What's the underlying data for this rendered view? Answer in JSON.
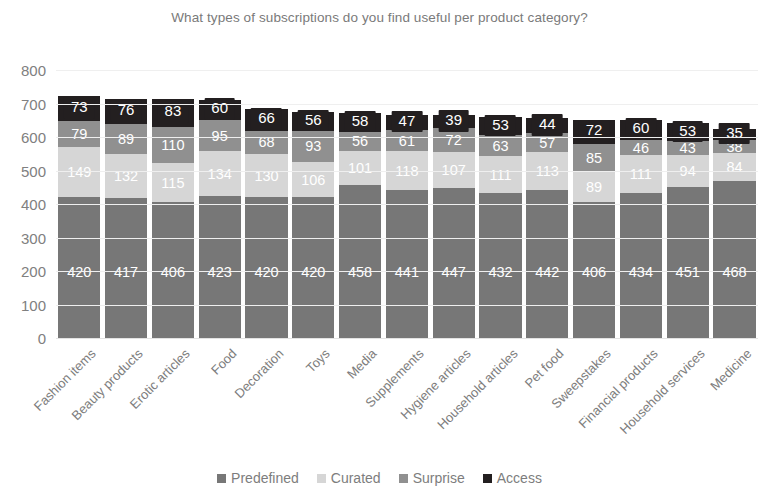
{
  "chart_data": {
    "type": "bar",
    "subtype": "stacked-column",
    "title": "What types of subscriptions do you find useful per product category?",
    "xlabel": "",
    "ylabel": "",
    "ylim": [
      0,
      800
    ],
    "ytick_step": 100,
    "yticks": [
      "800",
      "700",
      "600",
      "500",
      "400",
      "300",
      "200",
      "100",
      "0"
    ],
    "grid": true,
    "legend_position": "bottom",
    "categories": [
      "Fashion items",
      "Beauty products",
      "Erotic articles",
      "Food",
      "Decoration",
      "Toys",
      "Media",
      "Supplements",
      "Hygiene articles",
      "Household articles",
      "Pet food",
      "Sweepstakes",
      "Financial products",
      "Household services",
      "Medicine"
    ],
    "series": [
      {
        "name": "Predefined",
        "color": "#777777",
        "values": [
          420,
          417,
          406,
          423,
          420,
          420,
          458,
          441,
          447,
          432,
          442,
          406,
          434,
          451,
          468
        ]
      },
      {
        "name": "Curated",
        "color": "#d6d6d6",
        "values": [
          149,
          132,
          115,
          134,
          130,
          106,
          101,
          118,
          107,
          111,
          113,
          89,
          111,
          94,
          84
        ]
      },
      {
        "name": "Surprise",
        "color": "#909090",
        "values": [
          79,
          89,
          110,
          95,
          68,
          93,
          56,
          61,
          72,
          63,
          57,
          85,
          46,
          43,
          38
        ]
      },
      {
        "name": "Access",
        "color": "#231f20",
        "values": [
          73,
          76,
          83,
          60,
          66,
          56,
          58,
          47,
          39,
          53,
          44,
          72,
          60,
          53,
          35
        ]
      }
    ]
  },
  "legend": {
    "items": [
      {
        "label": "Predefined",
        "color": "#777777"
      },
      {
        "label": "Curated",
        "color": "#d6d6d6"
      },
      {
        "label": "Surprise",
        "color": "#909090"
      },
      {
        "label": "Access",
        "color": "#231f20"
      }
    ]
  }
}
